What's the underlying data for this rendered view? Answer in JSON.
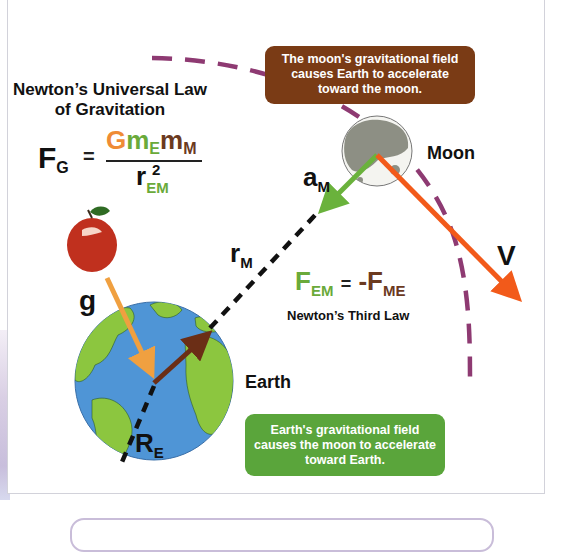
{
  "title": {
    "line1": "Newton’s Universal Law",
    "line2": "of Gravitation"
  },
  "formula": {
    "lhs": "F",
    "lhs_sub": "G",
    "equals": "=",
    "numerator": [
      {
        "text": "G",
        "color": "#ef8b35"
      },
      {
        "text": "m",
        "sub": "E",
        "color": "#6aaa3a"
      },
      {
        "text": "m",
        "sub": "M",
        "color": "#6b3a1f"
      }
    ],
    "denominator": {
      "text": "r",
      "sup": "2",
      "sub": "EM"
    }
  },
  "callouts": {
    "moon": "The moon's gravitational field causes Earth to accelerate toward the moon.",
    "earth": "Earth's gravitational field causes the moon to accelerate toward Earth."
  },
  "labels": {
    "moon": "Moon",
    "earth": "Earth",
    "a": "a",
    "a_sub": "M",
    "v": "V",
    "g": "g",
    "r": "r",
    "r_sub": "M",
    "R": "R",
    "R_sub": "E"
  },
  "third_law": {
    "lhs": "F",
    "lhs_sub": "EM",
    "equals": "=",
    "rhs": "-F",
    "rhs_sub": "ME",
    "caption": "Newton’s Third Law"
  },
  "colors": {
    "orbit": "#8e3a72",
    "velocity": "#f25a1a",
    "accel_moon": "#6ab23c",
    "gravity_g": "#f0a040",
    "earth_vector": "#6b2e16",
    "callout_moon_bg": "#7a3b15",
    "callout_earth_bg": "#5aa53b",
    "ocean": "#4f95d6",
    "land": "#8cc63f",
    "moon_surface": "#8d8f84",
    "apple": "#c0301e"
  }
}
